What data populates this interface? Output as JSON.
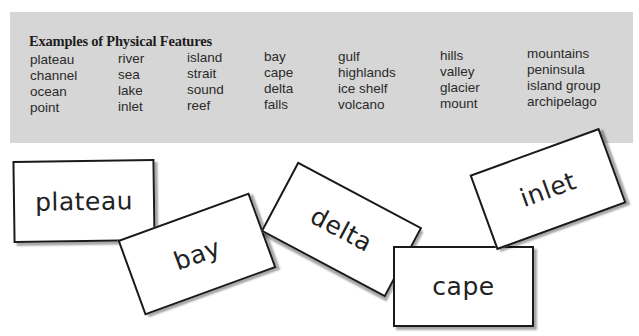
{
  "panel": {
    "title": "Examples of Physical Features",
    "columns": [
      [
        "plateau",
        "channel",
        "ocean",
        "point"
      ],
      [
        "river",
        "sea",
        "lake",
        "inlet"
      ],
      [
        "island",
        "strait",
        "sound",
        "reef"
      ],
      [
        "bay",
        "cape",
        "delta",
        "falls"
      ],
      [
        "gulf",
        "highlands",
        "ice shelf",
        "volcano"
      ],
      [
        "hills",
        "valley",
        "glacier",
        "mount"
      ],
      [
        "mountains",
        "peninsula",
        "island group",
        "archipelago"
      ]
    ]
  },
  "cards": [
    {
      "word": "plateau"
    },
    {
      "word": "bay"
    },
    {
      "word": "delta"
    },
    {
      "word": "cape"
    },
    {
      "word": "inlet"
    }
  ],
  "colors": {
    "panel_background": "#d6d6d6",
    "card_border": "#1a1a1a",
    "card_background": "#ffffff"
  }
}
